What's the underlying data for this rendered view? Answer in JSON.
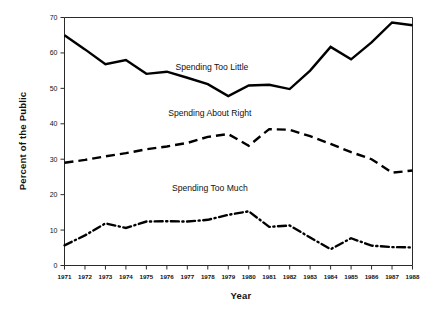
{
  "chart_data": {
    "type": "line",
    "title": "",
    "xlabel": "Year",
    "ylabel": "Percent of the Public",
    "grid": false,
    "legend_position": "inline-annotations",
    "xlim": [
      1971,
      1988
    ],
    "ylim": [
      0,
      70
    ],
    "ytick_step": 10,
    "yticks": [
      "0",
      "10",
      "20",
      "30",
      "40",
      "50",
      "60",
      "70"
    ],
    "categories": [
      1971,
      1972,
      1973,
      1974,
      1975,
      1976,
      1977,
      1978,
      1979,
      1980,
      1981,
      1982,
      1983,
      1984,
      1985,
      1986,
      1987,
      1988
    ],
    "xticks": [
      "1971",
      "1972",
      "1973",
      "1974",
      "1975",
      "1976",
      "1977",
      "1978",
      "1979",
      "1980",
      "1981",
      "1982",
      "1983",
      "1984",
      "1985",
      "1986",
      "1987",
      "1988"
    ],
    "series": [
      {
        "name": "Spending Too Little",
        "style": "solid",
        "color": "#000000",
        "values": [
          65.0,
          61.0,
          56.8,
          58.0,
          54.1,
          54.7,
          53.0,
          51.2,
          47.8,
          50.8,
          51.0,
          49.8,
          55.0,
          61.7,
          58.2,
          63.0,
          68.6,
          67.8
        ]
      },
      {
        "name": "Spending About Right",
        "style": "dashed",
        "color": "#000000",
        "values": [
          29.0,
          29.8,
          30.8,
          31.7,
          32.8,
          33.6,
          34.6,
          36.3,
          37.1,
          33.8,
          38.5,
          38.3,
          36.5,
          34.3,
          32.0,
          30.0,
          26.2,
          26.8
        ]
      },
      {
        "name": "Spending Too Much",
        "style": "dashdot",
        "color": "#000000",
        "values": [
          5.7,
          8.5,
          11.9,
          10.6,
          12.4,
          12.5,
          12.4,
          12.9,
          14.3,
          15.3,
          10.9,
          11.3,
          7.9,
          4.6,
          7.7,
          5.6,
          5.2,
          5.1
        ]
      }
    ],
    "annotations": [
      {
        "text": "Spending Too Little",
        "x": 1978.2,
        "y": 55.2
      },
      {
        "text": "Spending About Right",
        "x": 1978.1,
        "y": 42.3
      },
      {
        "text": "Spending Too Much",
        "x": 1978.1,
        "y": 21.0
      }
    ]
  }
}
